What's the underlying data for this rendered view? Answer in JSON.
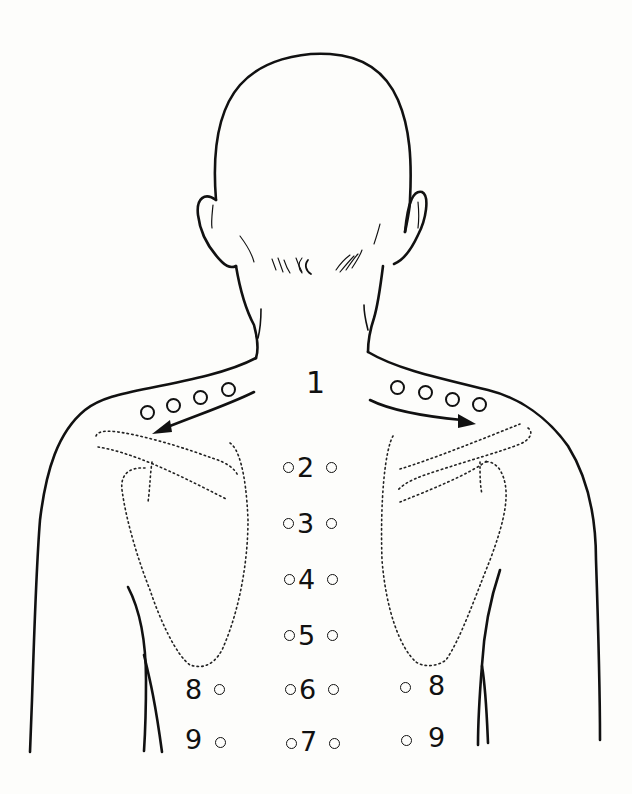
{
  "figure": {
    "background": "#fdfdfb",
    "line_color": "#111111",
    "labels": {
      "neck": "1",
      "spine": [
        "2",
        "3",
        "4",
        "5",
        "6",
        "7"
      ],
      "left_lower": [
        "8",
        "9"
      ],
      "right_lower": [
        "8",
        "9"
      ]
    },
    "shoulder_points_per_side": 4,
    "arrows": [
      "left-shoulder-arrow",
      "right-shoulder-arrow"
    ],
    "scapula_outlines": "dotted"
  }
}
